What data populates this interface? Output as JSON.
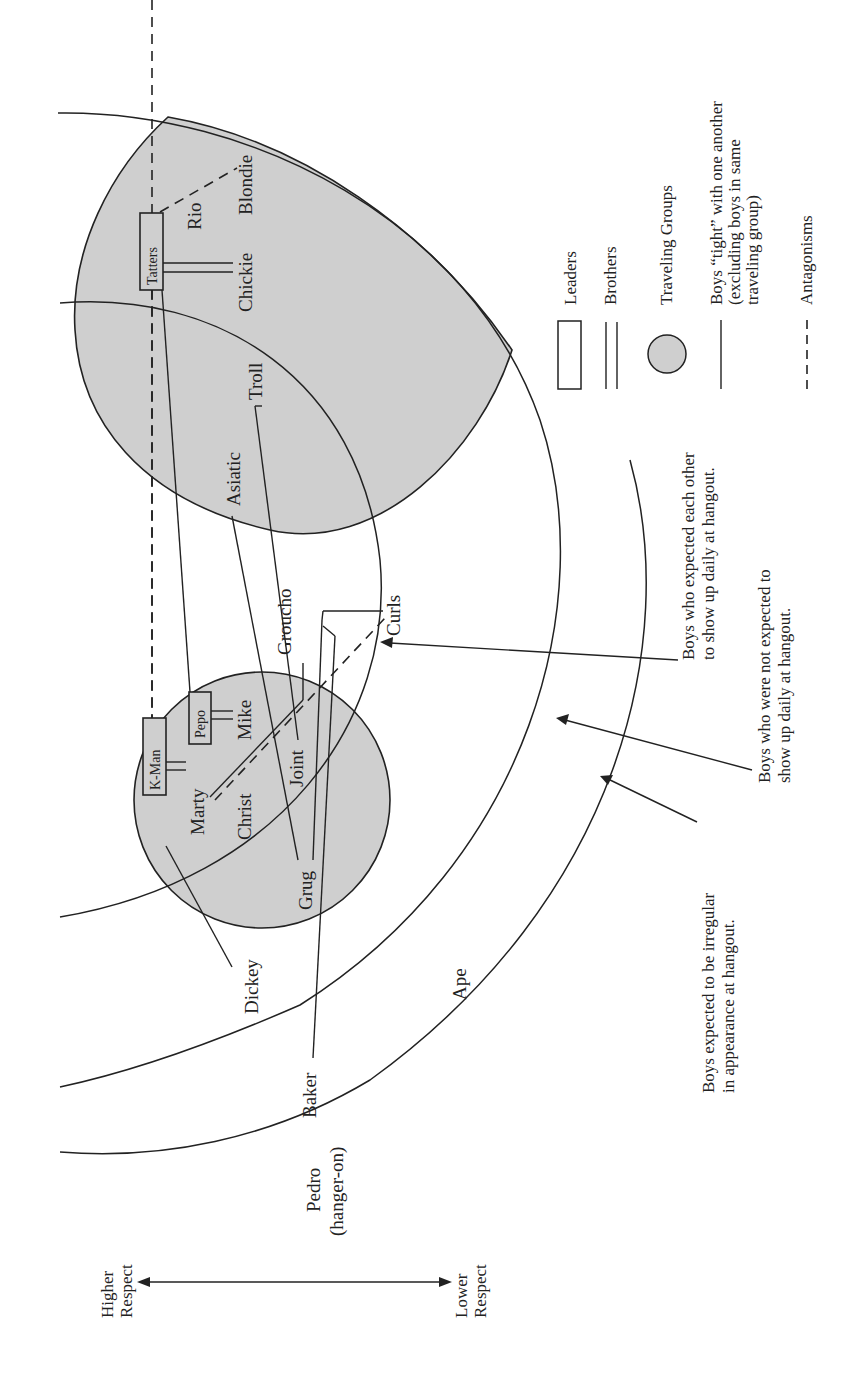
{
  "axis": {
    "higher_line1": "Higher",
    "higher_line2": "Respect",
    "lower_line1": "Lower",
    "lower_line2": "Respect"
  },
  "legend": {
    "leaders": "Leaders",
    "brothers": "Brothers",
    "traveling_groups": "Traveling Groups",
    "tight_line1": "Boys “tight” with one another",
    "tight_line2": "(excluding boys in same",
    "tight_line3": "traveling group)",
    "antagonisms": "Antagonisms"
  },
  "notes": {
    "inner_line1": "Boys who expected each other",
    "inner_line2": "to show up daily at hangout.",
    "middle_line1": "Boys who were not expected to",
    "middle_line2": "show up daily at hangout.",
    "outer_line1": "Boys expected to be irregular",
    "outer_line2": "in appearance at hangout."
  },
  "groups": {
    "large": {
      "leader": "Tatters",
      "members": [
        "Rio",
        "Blondie",
        "Chickie",
        "Troll",
        "Asiatic"
      ]
    },
    "small": {
      "leaders": [
        "K-Man",
        "Pepo"
      ],
      "members": [
        "Marty",
        "Mike",
        "Christ",
        "Joint",
        "Grug"
      ]
    }
  },
  "names": {
    "tatters": "Tatters",
    "rio": "Rio",
    "blondie": "Blondie",
    "chickie": "Chickie",
    "troll": "Troll",
    "asiatic": "Asiatic",
    "kman": "K-Man",
    "pepo": "Pepo",
    "marty": "Marty",
    "mike": "Mike",
    "christ": "Christ",
    "joint": "Joint",
    "grug": "Grug",
    "groucho": "Groucho",
    "curls": "Curls",
    "dickey": "Dickey",
    "baker": "Baker",
    "ape": "Ape",
    "pedro": "Pedro",
    "pedro_note": "(hanger-on)"
  },
  "relationships": {
    "brothers": [
      [
        "Tatters",
        "Chickie"
      ],
      [
        "K-Man",
        "Marty"
      ],
      [
        "Pepo",
        "Mike"
      ]
    ],
    "tight": [
      [
        "Tatters",
        "Pepo"
      ],
      [
        "Troll",
        "Joint"
      ],
      [
        "Asiatic",
        "Grug"
      ],
      [
        "Joint",
        "Groucho"
      ],
      [
        "Marty",
        "Curls"
      ],
      [
        "Grug",
        "Curls"
      ],
      [
        "Baker",
        "Curls"
      ],
      [
        "K-Man",
        "Dickey"
      ]
    ],
    "antagonisms": [
      [
        "Tatters",
        "Blondie"
      ],
      [
        "Tatters",
        "K-Man"
      ],
      [
        "Marty",
        "Curls"
      ]
    ]
  },
  "colors": {
    "group_fill": "#cfcfcf",
    "ink": "#222222",
    "background": "#ffffff"
  }
}
